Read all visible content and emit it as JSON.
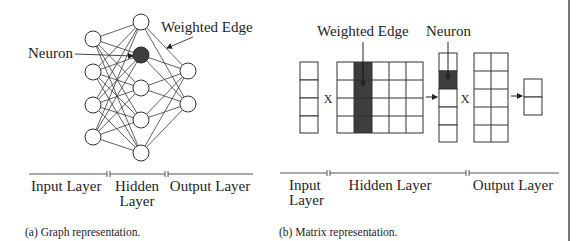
{
  "figure_a": {
    "annotations": {
      "neuron_label": "Neuron",
      "weighted_edge_label": "Weighted Edge"
    },
    "layers": {
      "input_label": "Input Layer",
      "hidden_label_line1": "Hidden",
      "hidden_label_line2": "Layer",
      "output_label": "Output Layer"
    },
    "network": {
      "input_neurons": 4,
      "hidden_neurons": 5,
      "output_neurons": 2,
      "highlighted_hidden_neuron_index": 1
    },
    "caption": "(a) Graph representation."
  },
  "figure_b": {
    "annotations": {
      "weighted_edge_label": "Weighted Edge",
      "neuron_label": "Neuron"
    },
    "operators": {
      "multiply_1": "X",
      "multiply_2": "X"
    },
    "layers": {
      "input_label_line1": "Input",
      "input_label_line2": "Layer",
      "hidden_label": "Hidden Layer",
      "output_label": "Output Layer"
    },
    "matrices": {
      "input_vector": {
        "rows": 4,
        "cols": 1
      },
      "hidden_weights": {
        "rows": 4,
        "cols": 5,
        "highlighted_col_index": 1
      },
      "hidden_vector": {
        "rows": 5,
        "cols": 1,
        "highlighted_row_index": 1
      },
      "output_weights": {
        "rows": 5,
        "cols": 2
      },
      "output_vector": {
        "rows": 2,
        "cols": 1
      }
    },
    "caption": "(b) Matrix representation."
  },
  "colors": {
    "highlight": "#3d3d3d",
    "stroke": "#333333",
    "text": "#1e1e1e"
  }
}
